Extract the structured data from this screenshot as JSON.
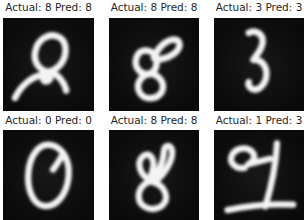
{
  "colors": {
    "background": "#ffffff",
    "image_bg": "#0a0a0a",
    "image_bg_center": "#181818",
    "text": "#262626",
    "digit": "#f4f4f4"
  },
  "grid": {
    "rows": 2,
    "cols": 3
  },
  "cells": [
    {
      "title": "Actual: 8 Pred: 8",
      "actual": "8",
      "pred": "8",
      "strokes": [
        "M50 58 C 39 56 33 46 36 35 C 39 22 52 15 62 21 C 71 27 70 42 62 51 C 58 55 54 57 50 58",
        "M14 86 C 20 73 31 64 43 61 C 52 59 55 65 49 68 C 43 70 42 62 50 59 C 55 57 62 63 66 70 C 68 74 69 76 69 78"
      ]
    },
    {
      "title": "Actual: 8 Pred: 8",
      "actual": "8",
      "pred": "8",
      "strokes": [
        "M50 43 C 53 33 62 24 71 23 C 79 23 80 31 72 38 C 64 44 54 46 50 43",
        "M52 41 C 45 32 34 33 31 43 C 28 53 36 62 45 60 C 52 58 54 50 52 44",
        "M46 60 C 56 61 63 71 58 80 C 52 89 38 88 34 79 C 30 70 37 61 46 60"
      ]
    },
    {
      "title": "Actual: 3 Pred: 3",
      "actual": "3",
      "pred": "3",
      "strokes": [
        "M39 16 C 46 12 54 17 54 25 C 54 33 48 39 44 45 C 52 44 58 51 58 60 C 58 70 50 80 42 76 C 39 74 38 71 39 69"
      ]
    },
    {
      "title": "Actual: 0 Pred: 0",
      "actual": "0",
      "pred": "0",
      "strokes": [
        "M52 17 C 64 19 74 32 72 52 C 70 72 58 86 45 84 C 32 82 26 64 28 46 C 30 28 40 15 52 17",
        "M64 30 C 61 36 58 40 55 44"
      ]
    },
    {
      "title": "Actual: 8 Pred: 8",
      "actual": "8",
      "pred": "8",
      "strokes": [
        "M46 56 C 34 50 30 36 38 29 C 46 23 52 34 48 46 C 47 50 46 53 46 56",
        "M46 56 C 54 50 60 38 61 24 C 61 17 68 15 70 22 C 72 32 62 50 50 58",
        "M50 58 C 62 62 68 76 59 84 C 49 92 33 86 33 74 C 33 63 42 57 48 57"
      ]
    },
    {
      "title": "Actual: 1 Pred: 3",
      "actual": "1",
      "pred": "3",
      "strokes": [
        "M34 42 C 24 44 16 36 20 28 C 24 20 36 18 42 24 C 47 29 44 35 38 38 C 46 36 54 34 62 32",
        "M70 15 C 69 35 64 62 57 85",
        "M15 89 C 38 84 65 82 88 83"
      ]
    }
  ],
  "chart_data": {
    "type": "table",
    "title": "",
    "columns": [
      "position",
      "actual",
      "predicted",
      "correct"
    ],
    "rows": [
      [
        "row1-col1",
        8,
        8,
        true
      ],
      [
        "row1-col2",
        8,
        8,
        true
      ],
      [
        "row1-col3",
        3,
        3,
        true
      ],
      [
        "row2-col1",
        0,
        0,
        true
      ],
      [
        "row2-col2",
        8,
        8,
        true
      ],
      [
        "row2-col3",
        1,
        3,
        false
      ]
    ]
  }
}
